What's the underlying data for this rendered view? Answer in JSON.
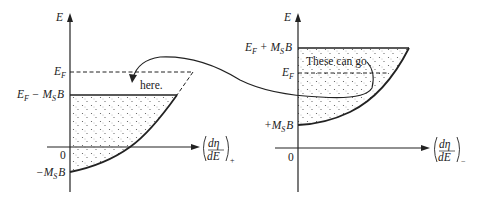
{
  "left_panel": {
    "y_axis_label": "E",
    "x_axis_label_num": "dη",
    "x_axis_label_den": "dE",
    "x_axis_subscript": "+",
    "levels": {
      "fermi": "E",
      "fermi_sub": "F",
      "upper_base": "E",
      "upper_base_sub": "F",
      "upper_minus": " − M",
      "upper_minus_sub": "S",
      "upper_B": "B",
      "zero": "0",
      "bottom_prefix": "−M",
      "bottom_sub": "S",
      "bottom_B": "B"
    },
    "annotation": "here."
  },
  "right_panel": {
    "y_axis_label": "E",
    "x_axis_label_num": "dη",
    "x_axis_label_den": "dE",
    "x_axis_subscript": "−",
    "levels": {
      "top_base": "E",
      "top_base_sub": "F",
      "top_plus": " + M",
      "top_plus_sub": "S",
      "top_B": "B",
      "fermi": "E",
      "fermi_sub": "F",
      "bottom_prefix": "+M",
      "bottom_sub": "S",
      "bottom_B": "B",
      "zero": "0"
    },
    "annotation": "These can go"
  },
  "colors": {
    "ink": "#222222",
    "background": "#ffffff",
    "stipple": "#555555"
  }
}
